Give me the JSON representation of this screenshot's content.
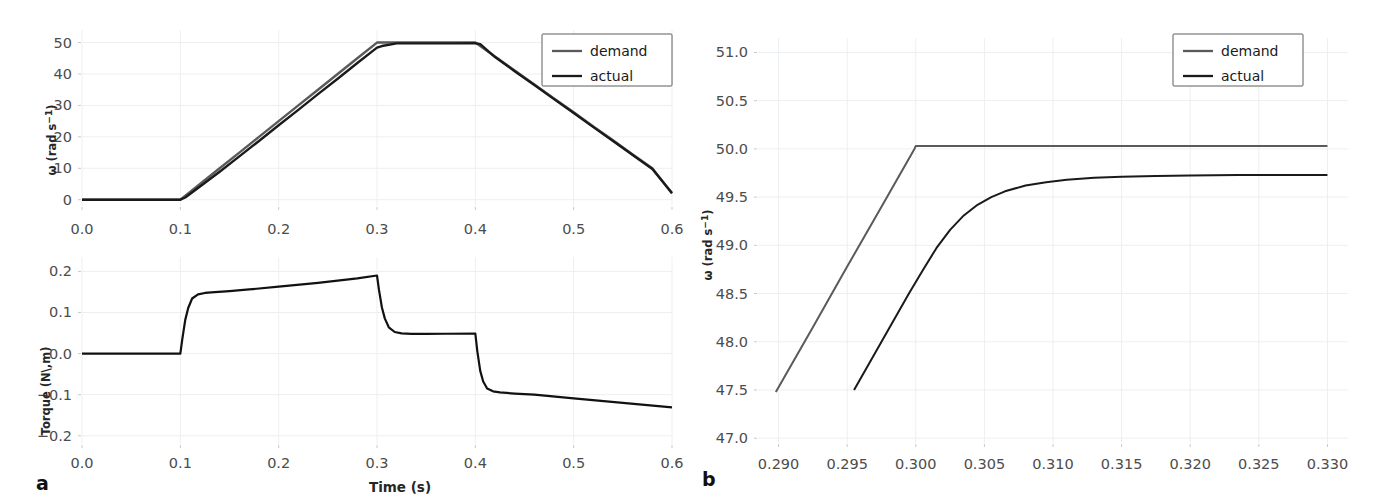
{
  "figure": {
    "panels": [
      {
        "id": "a",
        "label": "a",
        "xlabel": "Time (s)",
        "subplots": [
          "velocity",
          "torque"
        ]
      },
      {
        "id": "b",
        "label": "b",
        "xlabel": ""
      }
    ]
  },
  "legend": {
    "demand_label": "demand",
    "actual_label": "actual",
    "demand_color": "#5a5a5a",
    "actual_color": "#1a1a1a"
  },
  "labels": {
    "omega_base": "ω",
    "omega_unit_open": " (rad s",
    "omega_unit_exp": "−1",
    "omega_unit_close": ")",
    "torque_axis": "Torque (N\\,m)",
    "time_axis": "Time (s)"
  },
  "chart_data": [
    {
      "type": "line",
      "id": "panel-a-velocity",
      "title": "",
      "xlabel": "",
      "ylabel": "ω (rad s−1)",
      "xlim": [
        0.0,
        0.6
      ],
      "ylim": [
        -2.0,
        54.0
      ],
      "xticks": [
        0.0,
        0.1,
        0.2,
        0.3,
        0.4,
        0.5,
        0.6
      ],
      "xticklabels": [
        "0.0",
        "0.1",
        "0.2",
        "0.3",
        "0.4",
        "0.5",
        "0.6"
      ],
      "yticks": [
        0,
        10,
        20,
        30,
        40,
        50
      ],
      "yticklabels": [
        "0",
        "10",
        "20",
        "30",
        "40",
        "50"
      ],
      "grid": true,
      "legend_position": "top-right",
      "series": [
        {
          "name": "demand",
          "color": "#5a5a5a",
          "width": 2.4,
          "x": [
            0.0,
            0.02,
            0.04,
            0.06,
            0.08,
            0.1,
            0.12,
            0.14,
            0.16,
            0.18,
            0.2,
            0.22,
            0.24,
            0.26,
            0.28,
            0.3,
            0.32,
            0.34,
            0.36,
            0.38,
            0.4,
            0.42,
            0.44,
            0.46,
            0.48,
            0.5,
            0.52,
            0.54,
            0.56,
            0.58,
            0.6
          ],
          "y": [
            0,
            0,
            0,
            0,
            0,
            0,
            5.0,
            10.0,
            15.0,
            20.0,
            25.0,
            30.0,
            35.0,
            40.0,
            45.0,
            50.0,
            50.0,
            50.0,
            50.0,
            50.0,
            50.0,
            45.6,
            41.1,
            36.7,
            32.2,
            27.8,
            23.3,
            18.9,
            14.4,
            10.0,
            2.0
          ]
        },
        {
          "name": "actual",
          "color": "#1a1a1a",
          "width": 2.4,
          "x": [
            0.0,
            0.02,
            0.04,
            0.06,
            0.08,
            0.1,
            0.105,
            0.12,
            0.14,
            0.16,
            0.18,
            0.2,
            0.22,
            0.24,
            0.26,
            0.28,
            0.3,
            0.305,
            0.32,
            0.34,
            0.36,
            0.38,
            0.4,
            0.405,
            0.42,
            0.44,
            0.46,
            0.48,
            0.5,
            0.52,
            0.54,
            0.56,
            0.58,
            0.6
          ],
          "y": [
            0,
            0,
            0,
            0,
            0,
            0,
            0.7,
            4.2,
            8.9,
            13.8,
            18.7,
            23.7,
            28.6,
            33.6,
            38.5,
            43.5,
            48.4,
            48.9,
            49.73,
            49.74,
            49.75,
            49.76,
            49.77,
            49.5,
            45.4,
            40.9,
            36.5,
            32.0,
            27.6,
            23.1,
            18.7,
            14.2,
            9.8,
            2.1
          ]
        }
      ]
    },
    {
      "type": "line",
      "id": "panel-a-torque",
      "title": "",
      "xlabel": "Time (s)",
      "ylabel": "Torque (N\\,m)",
      "xlim": [
        0.0,
        0.6
      ],
      "ylim": [
        -0.22,
        0.235
      ],
      "xticks": [
        0.0,
        0.1,
        0.2,
        0.3,
        0.4,
        0.5,
        0.6
      ],
      "xticklabels": [
        "0.0",
        "0.1",
        "0.2",
        "0.3",
        "0.4",
        "0.5",
        "0.6"
      ],
      "yticks": [
        -0.2,
        -0.1,
        0.0,
        0.1,
        0.2
      ],
      "yticklabels": [
        "−0.2",
        "−0.1",
        "0.0",
        "0.1",
        "0.2"
      ],
      "grid": true,
      "legend_position": "none",
      "series": [
        {
          "name": "torque",
          "color": "#111111",
          "width": 2.2,
          "x": [
            0.0,
            0.05,
            0.095,
            0.1,
            0.102,
            0.105,
            0.108,
            0.112,
            0.118,
            0.125,
            0.135,
            0.15,
            0.17,
            0.2,
            0.24,
            0.28,
            0.3,
            0.302,
            0.305,
            0.308,
            0.312,
            0.318,
            0.325,
            0.335,
            0.35,
            0.37,
            0.4,
            0.402,
            0.405,
            0.408,
            0.412,
            0.418,
            0.425,
            0.44,
            0.46,
            0.5,
            0.55,
            0.6
          ],
          "y": [
            0.0,
            0.0,
            0.0,
            0.0,
            0.035,
            0.082,
            0.111,
            0.134,
            0.144,
            0.1475,
            0.1495,
            0.152,
            0.156,
            0.163,
            0.172,
            0.183,
            0.19,
            0.155,
            0.112,
            0.085,
            0.064,
            0.0525,
            0.049,
            0.0478,
            0.0478,
            0.0482,
            0.0488,
            0.006,
            -0.042,
            -0.068,
            -0.085,
            -0.0918,
            -0.0945,
            -0.0972,
            -0.1,
            -0.109,
            -0.12,
            -0.131
          ]
        }
      ]
    },
    {
      "type": "line",
      "id": "panel-b",
      "title": "",
      "xlabel": "",
      "ylabel": "ω (rad s−1)",
      "xlim": [
        0.2885,
        0.3315
      ],
      "ylim": [
        46.95,
        51.15
      ],
      "xticks": [
        0.29,
        0.295,
        0.3,
        0.305,
        0.31,
        0.315,
        0.32,
        0.325,
        0.33
      ],
      "xticklabels": [
        "0.290",
        "0.295",
        "0.300",
        "0.305",
        "0.310",
        "0.315",
        "0.320",
        "0.325",
        "0.330"
      ],
      "yticks": [
        47.0,
        47.5,
        48.0,
        48.5,
        49.0,
        49.5,
        50.0,
        50.5,
        51.0
      ],
      "yticklabels": [
        "47.0",
        "47.5",
        "48.0",
        "48.5",
        "49.0",
        "49.5",
        "50.0",
        "50.5",
        "51.0"
      ],
      "grid": true,
      "legend_position": "top-right",
      "series": [
        {
          "name": "demand",
          "color": "#5a5a5a",
          "width": 2.0,
          "x": [
            0.2898,
            0.2925,
            0.295,
            0.2975,
            0.2999,
            0.3,
            0.305,
            0.31,
            0.315,
            0.32,
            0.325,
            0.33
          ],
          "y": [
            47.48,
            48.15,
            48.78,
            49.4,
            50.0,
            50.03,
            50.03,
            50.03,
            50.03,
            50.03,
            50.03,
            50.03
          ]
        },
        {
          "name": "actual",
          "color": "#1a1a1a",
          "width": 2.0,
          "x": [
            0.2955,
            0.2975,
            0.2995,
            0.3005,
            0.3015,
            0.3025,
            0.3035,
            0.3045,
            0.3055,
            0.3065,
            0.308,
            0.3095,
            0.311,
            0.313,
            0.315,
            0.3175,
            0.32,
            0.3235,
            0.327,
            0.33
          ],
          "y": [
            47.5,
            48.0,
            48.5,
            48.74,
            48.97,
            49.16,
            49.31,
            49.42,
            49.5,
            49.56,
            49.62,
            49.655,
            49.68,
            49.7,
            49.71,
            49.72,
            49.725,
            49.73,
            49.73,
            49.73
          ]
        }
      ]
    }
  ]
}
